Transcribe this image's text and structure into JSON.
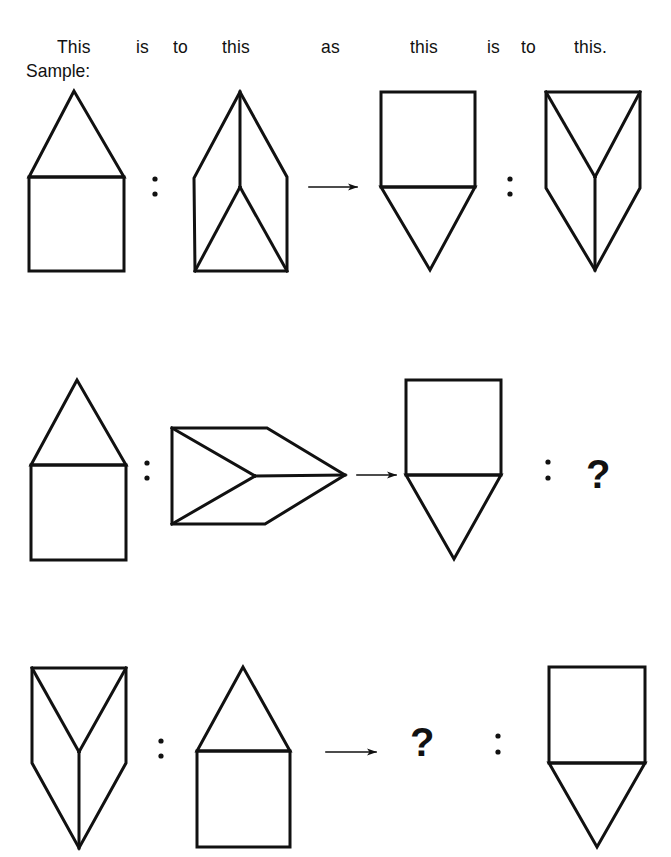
{
  "header": {
    "words": [
      "This",
      "is",
      "to",
      "this",
      "as",
      "this",
      "is",
      "to",
      "this."
    ]
  },
  "sample_label": "Sample:",
  "colors": {
    "ink": "#111111",
    "background": "#ffffff"
  },
  "rows": [
    {
      "name": "sample",
      "items": [
        {
          "shape": "house-triangle-on-square"
        },
        {
          "separator": ":"
        },
        {
          "shape": "prism-pointing-up"
        },
        {
          "connector": "arrow-right"
        },
        {
          "shape": "square-with-triangle-below"
        },
        {
          "separator": ":"
        },
        {
          "shape": "prism-pointing-down"
        }
      ]
    },
    {
      "name": "problem-1",
      "items": [
        {
          "shape": "house-triangle-on-square"
        },
        {
          "separator": ":"
        },
        {
          "shape": "prism-pointing-right"
        },
        {
          "connector": "arrow-right"
        },
        {
          "shape": "square-with-triangle-below"
        },
        {
          "separator": ":"
        },
        {
          "unknown": "?"
        }
      ]
    },
    {
      "name": "problem-2",
      "items": [
        {
          "shape": "prism-pointing-down"
        },
        {
          "separator": ":"
        },
        {
          "shape": "house-triangle-on-square"
        },
        {
          "connector": "arrow-right"
        },
        {
          "unknown": "?"
        },
        {
          "separator": ":"
        },
        {
          "shape": "square-with-triangle-below"
        }
      ]
    }
  ],
  "unknowns": {
    "problem_1": "?",
    "problem_2": "?"
  }
}
